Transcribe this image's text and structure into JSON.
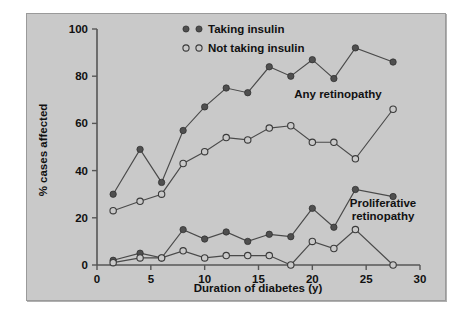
{
  "figure": {
    "background_color": "#ffffff",
    "panel_color": "#c9c9c9",
    "border_color": "#9a9a9a"
  },
  "legend": {
    "position": "top-center",
    "entries": [
      {
        "label": "Taking insulin",
        "marker": "filled-circle",
        "color": "#4f4f4f"
      },
      {
        "label": "Not taking insulin",
        "marker": "open-circle",
        "color": "#c9c9c9"
      }
    ]
  },
  "annotations": [
    {
      "name": "any-retinopathy-label",
      "text": "Any retinopathy",
      "x": 21.5,
      "y": 72
    },
    {
      "name": "proliferative-retinopathy-label",
      "line1": "Proliferative",
      "line2": "retinopathy",
      "x": 24.5,
      "y": 27
    }
  ],
  "axes": {
    "x": {
      "label": "Duration of diabetes (y)",
      "min": 0,
      "max": 30,
      "ticks": [
        0,
        5,
        10,
        15,
        20,
        25,
        30
      ],
      "tick_labels": [
        "0",
        "5",
        "10",
        "15",
        "20",
        "25",
        "30"
      ]
    },
    "y": {
      "label": "% cases affected",
      "min": 0,
      "max": 100,
      "ticks": [
        0,
        20,
        40,
        60,
        80,
        100
      ],
      "tick_labels": [
        "0",
        "20",
        "40",
        "60",
        "80",
        "100"
      ]
    }
  },
  "chart_data": {
    "type": "line",
    "title": "",
    "xlabel": "Duration of diabetes (y)",
    "ylabel": "% cases affected",
    "xlim": [
      0,
      30
    ],
    "ylim": [
      0,
      100
    ],
    "grid": false,
    "legend_position": "top-center",
    "x": [
      1.5,
      4,
      6,
      8,
      10,
      12,
      14,
      16,
      18,
      20,
      22,
      24,
      27.5
    ],
    "series": [
      {
        "name": "Any retinopathy — Taking insulin",
        "group": "Any retinopathy",
        "marker": "filled-circle",
        "values": [
          30,
          49,
          35,
          57,
          67,
          75,
          73,
          84,
          80,
          87,
          79,
          92,
          86
        ]
      },
      {
        "name": "Any retinopathy — Not taking insulin",
        "group": "Any retinopathy",
        "marker": "open-circle",
        "values": [
          23,
          27,
          30,
          43,
          48,
          54,
          53,
          58,
          59,
          52,
          52,
          45,
          66
        ]
      },
      {
        "name": "Proliferative retinopathy — Taking insulin",
        "group": "Proliferative retinopathy",
        "marker": "filled-circle",
        "values": [
          2,
          5,
          3,
          15,
          11,
          14,
          10,
          13,
          12,
          24,
          16,
          32,
          29
        ]
      },
      {
        "name": "Proliferative retinopathy — Not taking insulin",
        "group": "Proliferative retinopathy",
        "marker": "open-circle",
        "values": [
          1,
          3,
          3,
          6,
          3,
          4,
          4,
          4,
          0,
          10,
          7,
          15,
          0
        ]
      }
    ]
  }
}
